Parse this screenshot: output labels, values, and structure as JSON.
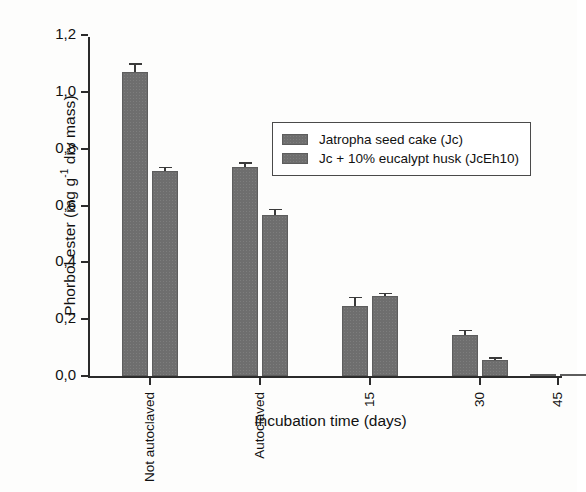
{
  "chart_data": {
    "type": "bar",
    "title": "",
    "xlabel": "Incubation time (days)",
    "ylabel": "Phorbol ester (mg g-1 dry mass)",
    "ylabel_parts": {
      "prefix": "Phorbol ester (mg g",
      "superscript": "-1",
      "suffix": " dry mass)"
    },
    "categories": [
      "Not autoclaved",
      "Autoclaved",
      "15",
      "30",
      "45"
    ],
    "ylim": [
      0.0,
      1.2
    ],
    "ytick_labels": [
      "0,0",
      "0,2",
      "0,4",
      "0,6",
      "0,8",
      "1,0",
      "1,2"
    ],
    "ytick_values": [
      0.0,
      0.2,
      0.4,
      0.6,
      0.8,
      1.0,
      1.2
    ],
    "grid": false,
    "legend_position": "upper center",
    "series": [
      {
        "name": "Jatropha seed cake (Jc)",
        "color": "#6e6e6e",
        "values": [
          1.07,
          0.735,
          0.245,
          0.145,
          0.005
        ],
        "errors": [
          0.025,
          0.012,
          0.028,
          0.012,
          0.002
        ]
      },
      {
        "name": "Jc + 10% eucalypt husk (JcEh10)",
        "color": "#6e6e6e",
        "values": [
          0.72,
          0.565,
          0.28,
          0.055,
          0.005
        ],
        "errors": [
          0.012,
          0.018,
          0.008,
          0.005,
          0.002
        ]
      }
    ]
  },
  "legend": {
    "entries": [
      "Jatropha seed cake (Jc)",
      "Jc + 10% eucalypt husk (JcEh10)"
    ]
  }
}
